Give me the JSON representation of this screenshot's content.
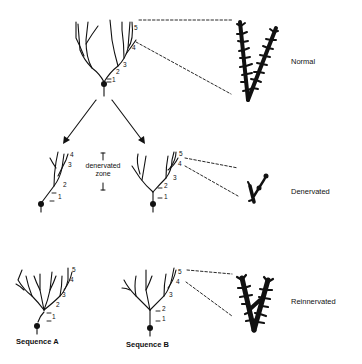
{
  "diagram": {
    "rows": [
      {
        "id": "normal",
        "label": "Normal"
      },
      {
        "id": "denervated",
        "label": "Denervated"
      },
      {
        "id": "reinnervated",
        "label": "Reinnervated"
      }
    ],
    "zone_label_line1": "denervated",
    "zone_label_line2": "zone",
    "sequences": [
      {
        "id": "A",
        "label": "Sequence A"
      },
      {
        "id": "B",
        "label": "Sequence B"
      }
    ],
    "branch_orders": [
      "1",
      "2",
      "3",
      "4",
      "5"
    ],
    "colors": {
      "ink": "#111111",
      "background": "#ffffff"
    }
  }
}
